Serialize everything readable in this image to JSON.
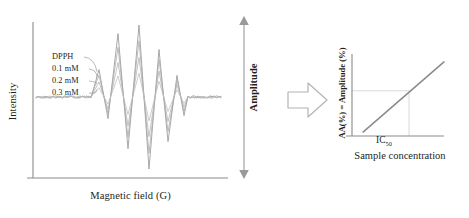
{
  "figure": {
    "arrow_icon": "block-arrow-right",
    "amplitude_annotation": {
      "label": "Amplitude",
      "icon": "double-headed-vertical-arrow"
    }
  },
  "chart_data": [
    {
      "type": "line",
      "id": "epr-spectrum",
      "title": "",
      "xlabel": "Magnetic field (G)",
      "ylabel": "Intensity",
      "grid": false,
      "legend_position": "inside-left",
      "axis_ticks": false,
      "description": "EPR first-derivative spectra of DPPH radical with increasing sample concentration; signal amplitude decreases as concentration increases.",
      "series": [
        {
          "name": "DPPH",
          "color": "#9a9a9a",
          "amplitude_scale": 1.0,
          "label_position": {
            "x": 52,
            "y": 52
          },
          "peaks": [
            0.38,
            0.88,
            1.0,
            0.66,
            0.3
          ],
          "troughs": [
            -0.3,
            -0.72,
            -1.0,
            -0.62,
            -0.26
          ]
        },
        {
          "name": "0.1 mM",
          "color": "#a8a8a8",
          "amplitude_scale": 0.78,
          "label_position": {
            "x": 52,
            "y": 64
          },
          "peaks": [
            0.3,
            0.69,
            0.78,
            0.52,
            0.23
          ],
          "troughs": [
            -0.23,
            -0.56,
            -0.78,
            -0.48,
            -0.2
          ]
        },
        {
          "name": "0.2 mM",
          "color": "#b0b0b0",
          "amplitude_scale": 0.55,
          "label_position": {
            "x": 52,
            "y": 76
          },
          "peaks": [
            0.21,
            0.48,
            0.55,
            0.36,
            0.17
          ],
          "troughs": [
            -0.17,
            -0.4,
            -0.55,
            -0.34,
            -0.14
          ]
        },
        {
          "name": "0.3 mM",
          "color": "#bcbcbc",
          "amplitude_scale": 0.33,
          "label_position": {
            "x": 52,
            "y": 88
          },
          "peaks": [
            0.13,
            0.29,
            0.33,
            0.22,
            0.1
          ],
          "troughs": [
            -0.1,
            -0.24,
            -0.33,
            -0.2,
            -0.09
          ]
        }
      ]
    },
    {
      "type": "line",
      "id": "antioxidant-activity-regression",
      "title": "",
      "xlabel": "Sample concentration",
      "ylabel": "AA(%) = Amplitude (%)",
      "grid": false,
      "axis_ticks": false,
      "annotations": [
        {
          "text": "IC",
          "subscript": "50",
          "kind": "x-axis-marker",
          "description": "Concentration at which activity reaches 50%"
        }
      ],
      "description": "Linear increase of antioxidant activity with sample concentration; dashed guide lines drop from the regression line to the IC50 concentration.",
      "x": [
        0.12,
        1.0
      ],
      "y": [
        0.05,
        0.95
      ],
      "guide_point": {
        "x": 0.62,
        "y": 0.58
      }
    }
  ],
  "labels": {
    "epr_ylabel": "Intensity",
    "epr_xlabel": "Magnetic field (G)",
    "amplitude": "Amplitude",
    "reg_ylabel": "AA(%) = Amplitude (%)",
    "reg_xlabel": "Sample concentration",
    "ic50_text": "IC",
    "ic50_sub": "50"
  },
  "colors": {
    "axis": "#8a8a8a",
    "trace_dpph": "#9a9a9a",
    "trace_01": "#a8a8a8",
    "trace_02": "#b0b0b0",
    "trace_03": "#bcbcbc",
    "text": "#231f20",
    "guide": "#c9c9c9",
    "background": "#ffffff"
  }
}
